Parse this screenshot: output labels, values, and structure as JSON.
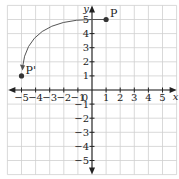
{
  "diagram": {
    "type": "coordinate-plane-rotation",
    "axes": {
      "x_label": "x",
      "y_label": "y",
      "origin_label": "0",
      "x_ticks": [
        "-5",
        "-4",
        "-3",
        "-2",
        "-1",
        "1",
        "2",
        "3",
        "4",
        "5"
      ],
      "y_ticks": [
        "5",
        "4",
        "3",
        "2",
        "1",
        "-1",
        "-2",
        "-3",
        "-4",
        "-5"
      ],
      "range": {
        "x": [
          -6,
          6
        ],
        "y": [
          -6,
          6
        ]
      }
    },
    "points": [
      {
        "label": "P",
        "x": 1,
        "y": 5
      },
      {
        "label": "P'",
        "x": -5,
        "y": 1
      }
    ],
    "arc": {
      "from": "P",
      "to": "P'",
      "center": [
        1,
        1
      ],
      "description": "counterclockwise rotation 90° about (1,1)"
    },
    "colors": {
      "grid": "#cfcfcf",
      "axis": "#222222",
      "arc": "#555555",
      "point": "#333333"
    }
  }
}
